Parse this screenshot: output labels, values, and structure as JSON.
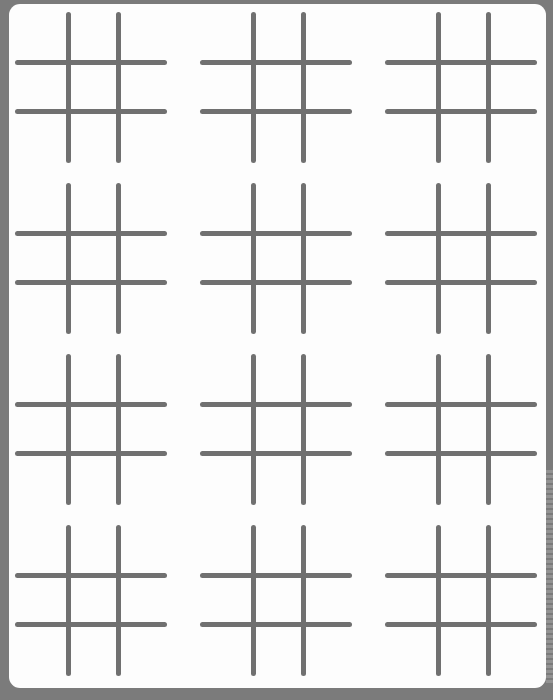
{
  "sheet": {
    "background_color": "#fdfdfd",
    "frame_color": "#7b7b7b",
    "line_color": "#707070",
    "layout": {
      "columns": 3,
      "rows": 4
    },
    "boards": [
      {
        "row": 1,
        "col": 1,
        "cells": [
          "",
          "",
          "",
          "",
          "",
          "",
          "",
          "",
          ""
        ]
      },
      {
        "row": 1,
        "col": 2,
        "cells": [
          "",
          "",
          "",
          "",
          "",
          "",
          "",
          "",
          ""
        ]
      },
      {
        "row": 1,
        "col": 3,
        "cells": [
          "",
          "",
          "",
          "",
          "",
          "",
          "",
          "",
          ""
        ]
      },
      {
        "row": 2,
        "col": 1,
        "cells": [
          "",
          "",
          "",
          "",
          "",
          "",
          "",
          "",
          ""
        ]
      },
      {
        "row": 2,
        "col": 2,
        "cells": [
          "",
          "",
          "",
          "",
          "",
          "",
          "",
          "",
          ""
        ]
      },
      {
        "row": 2,
        "col": 3,
        "cells": [
          "",
          "",
          "",
          "",
          "",
          "",
          "",
          "",
          ""
        ]
      },
      {
        "row": 3,
        "col": 1,
        "cells": [
          "",
          "",
          "",
          "",
          "",
          "",
          "",
          "",
          ""
        ]
      },
      {
        "row": 3,
        "col": 2,
        "cells": [
          "",
          "",
          "",
          "",
          "",
          "",
          "",
          "",
          ""
        ]
      },
      {
        "row": 3,
        "col": 3,
        "cells": [
          "",
          "",
          "",
          "",
          "",
          "",
          "",
          "",
          ""
        ]
      },
      {
        "row": 4,
        "col": 1,
        "cells": [
          "",
          "",
          "",
          "",
          "",
          "",
          "",
          "",
          ""
        ]
      },
      {
        "row": 4,
        "col": 2,
        "cells": [
          "",
          "",
          "",
          "",
          "",
          "",
          "",
          "",
          ""
        ]
      },
      {
        "row": 4,
        "col": 3,
        "cells": [
          "",
          "",
          "",
          "",
          "",
          "",
          "",
          "",
          ""
        ]
      }
    ]
  }
}
